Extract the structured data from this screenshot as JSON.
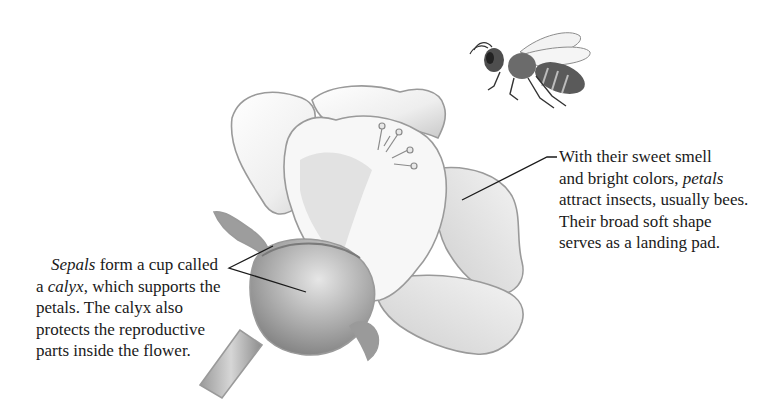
{
  "diagram": {
    "illustrations": [
      {
        "name": "flower",
        "description": "pencil sketch of a flower with petals, stamens, calyx and stem"
      },
      {
        "name": "bee",
        "description": "pencil sketch of a honey bee in flight, upper right"
      }
    ],
    "callouts": {
      "petals": {
        "lines": [
          {
            "parts": [
              {
                "text": "With their sweet smell",
                "italic": false
              }
            ]
          },
          {
            "parts": [
              {
                "text": "and bright colors, ",
                "italic": false
              },
              {
                "text": "petals",
                "italic": true
              }
            ]
          },
          {
            "parts": [
              {
                "text": "attract insects, usually bees.",
                "italic": false
              }
            ]
          },
          {
            "parts": [
              {
                "text": "Their broad soft shape",
                "italic": false
              }
            ]
          },
          {
            "parts": [
              {
                "text": "serves as a landing pad.",
                "italic": false
              }
            ]
          }
        ],
        "full_text": "With their sweet smell and bright colors, petals attract insects, usually bees. Their broad soft shape serves as a landing pad.",
        "leader_line": {
          "from": [
            557,
            157
          ],
          "elbow": [
            547,
            157
          ],
          "to": [
            462,
            200
          ]
        }
      },
      "sepals": {
        "lines": [
          {
            "parts": [
              {
                "text": "Sepals",
                "italic": true
              },
              {
                "text": " form a cup called",
                "italic": false
              }
            ]
          },
          {
            "parts": [
              {
                "text": "a ",
                "italic": false
              },
              {
                "text": "calyx",
                "italic": true
              },
              {
                "text": ", which supports the",
                "italic": false
              }
            ]
          },
          {
            "parts": [
              {
                "text": "petals. The calyx also",
                "italic": false
              }
            ]
          },
          {
            "parts": [
              {
                "text": "protects the reproductive",
                "italic": false
              }
            ]
          },
          {
            "parts": [
              {
                "text": "parts inside the flower.",
                "italic": false
              }
            ]
          }
        ],
        "full_text": "Sepals form a cup called a calyx, which supports the petals. The calyx also protects the reproductive parts inside the flower.",
        "leader_lines": [
          {
            "from": [
              229,
              268
            ],
            "to": [
              273,
              246
            ]
          },
          {
            "from": [
              229,
              268
            ],
            "to": [
              306,
              292
            ]
          }
        ]
      }
    }
  }
}
